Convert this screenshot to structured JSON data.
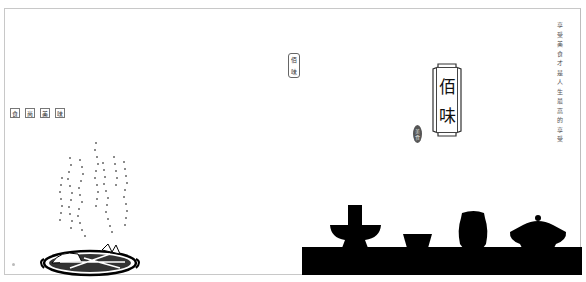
{
  "title": {
    "line1": "佰",
    "line2": "味"
  },
  "small_plaque": {
    "chars": [
      "佰",
      "味"
    ]
  },
  "seal": {
    "chars": [
      "美",
      "食"
    ]
  },
  "tags": [
    "食",
    "尚",
    "美",
    "味"
  ],
  "vertical_slogan": [
    "享",
    "受",
    "美",
    "食",
    "才",
    "是",
    "人",
    "生",
    "最",
    "高",
    "的",
    "享",
    "受"
  ],
  "illustrations": {
    "left": "hotpot-with-steam",
    "right": [
      "stem-bowl",
      "small-bowl",
      "jar",
      "lidded-pot"
    ]
  },
  "colors": {
    "ink": "#000000",
    "frame": "#c8c8c8",
    "paper": "#ffffff"
  }
}
